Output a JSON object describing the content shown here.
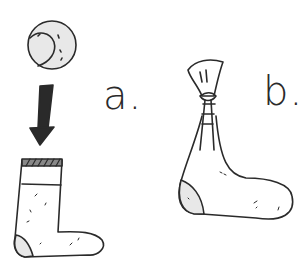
{
  "illustration": {
    "panels": [
      {
        "id": "a",
        "label": "a.",
        "description": "tennis ball dropped into sock"
      },
      {
        "id": "b",
        "label": "b.",
        "description": "sock tied off above ball"
      }
    ],
    "colors": {
      "ink": "#2a2a2a",
      "fill_light": "#e8e8e8",
      "background": "#ffffff"
    }
  }
}
